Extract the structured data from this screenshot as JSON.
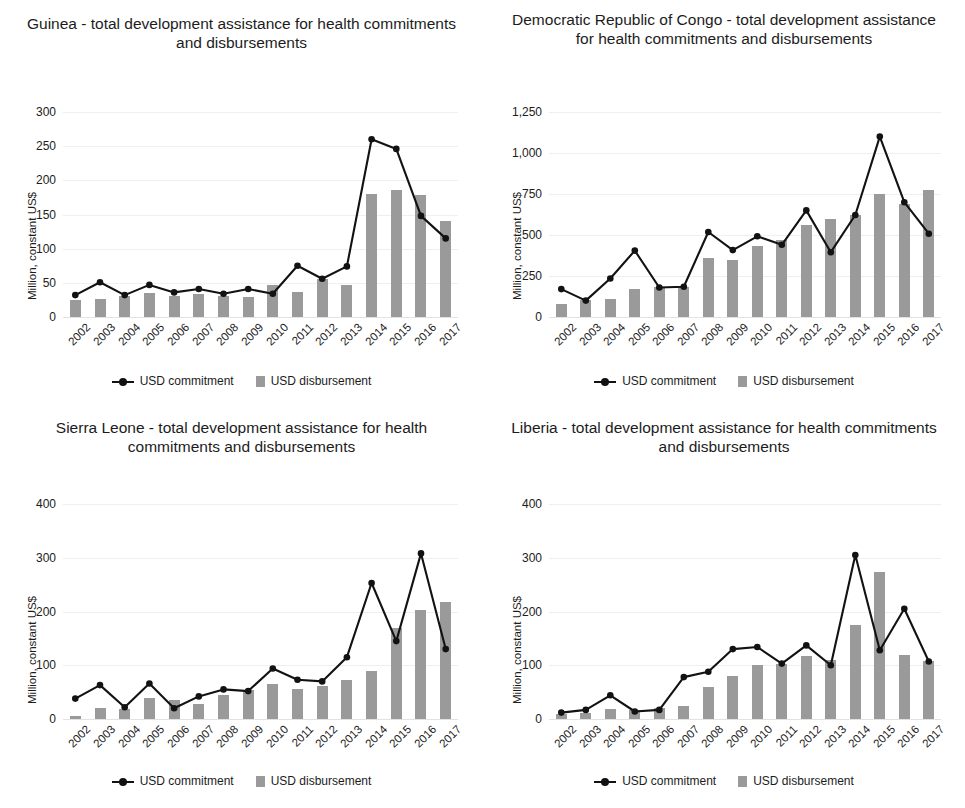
{
  "figure": {
    "series_labels": {
      "commitment": "USD commitment",
      "disbursement": "USD disbursement"
    },
    "colors": {
      "line": "#121212",
      "bar": "#9a9a9a",
      "gridline": "#efefef",
      "background": "#ffffff"
    }
  },
  "chart_data": [
    {
      "type": "bar",
      "id": "guinea",
      "title": "Guinea - total development assistance for health commitments and disbursements",
      "xlabel": "",
      "ylabel": "Million, constant US$",
      "ylim": [
        0,
        300
      ],
      "yticks": [
        0,
        50,
        100,
        150,
        200,
        250,
        300
      ],
      "ytick_labels": [
        "0",
        "50",
        "100",
        "150",
        "200",
        "250",
        "300"
      ],
      "grid": true,
      "legend_position": "bottom",
      "categories": [
        "2002",
        "2003",
        "2004",
        "2005",
        "2006",
        "2007",
        "2008",
        "2009",
        "2010",
        "2011",
        "2012",
        "2013",
        "2014",
        "2015",
        "2016",
        "2017"
      ],
      "series": [
        {
          "name": "USD disbursement",
          "type": "bar",
          "values": [
            25,
            26,
            31,
            35,
            31,
            33,
            31,
            30,
            47,
            37,
            56,
            47,
            180,
            186,
            178,
            141
          ]
        },
        {
          "name": "USD commitment",
          "type": "line",
          "values": [
            32,
            51,
            32,
            47,
            36,
            41,
            34,
            41,
            34,
            75,
            56,
            74,
            260,
            246,
            148,
            115
          ]
        }
      ]
    },
    {
      "type": "bar",
      "id": "drc",
      "title": "Democratic Republic of Congo - total development assistance for health commitments and disbursements",
      "xlabel": "",
      "ylabel": "Million, constant US$",
      "ylim": [
        0,
        1250
      ],
      "yticks": [
        0,
        250,
        500,
        750,
        1000,
        1250
      ],
      "ytick_labels": [
        "0",
        "250",
        "500",
        "750",
        "1,000",
        "1,250"
      ],
      "grid": true,
      "legend_position": "bottom",
      "categories": [
        "2002",
        "2003",
        "2004",
        "2005",
        "2006",
        "2007",
        "2008",
        "2009",
        "2010",
        "2011",
        "2012",
        "2013",
        "2014",
        "2015",
        "2016",
        "2017"
      ],
      "series": [
        {
          "name": "USD disbursement",
          "type": "bar",
          "values": [
            80,
            105,
            107,
            172,
            183,
            182,
            362,
            350,
            432,
            468,
            560,
            600,
            620,
            748,
            690,
            775
          ]
        },
        {
          "name": "USD commitment",
          "type": "line",
          "values": [
            170,
            100,
            235,
            405,
            180,
            185,
            518,
            408,
            492,
            440,
            650,
            395,
            622,
            1100,
            700,
            508
          ]
        }
      ]
    },
    {
      "type": "bar",
      "id": "sierra-leone",
      "title": "Sierra Leone - total development assistance for health commitments and disbursements",
      "xlabel": "",
      "ylabel": "Million, constant US$",
      "ylim": [
        0,
        400
      ],
      "yticks": [
        0,
        100,
        200,
        300,
        400
      ],
      "ytick_labels": [
        "0",
        "100",
        "200",
        "300",
        "400"
      ],
      "grid": true,
      "legend_position": "bottom",
      "categories": [
        "2002",
        "2003",
        "2004",
        "2005",
        "2006",
        "2007",
        "2008",
        "2009",
        "2010",
        "2011",
        "2012",
        "2013",
        "2014",
        "2015",
        "2016",
        "2017"
      ],
      "series": [
        {
          "name": "USD disbursement",
          "type": "bar",
          "values": [
            5,
            20,
            18,
            40,
            35,
            28,
            45,
            54,
            66,
            55,
            62,
            72,
            90,
            170,
            203,
            218,
            177
          ]
        },
        {
          "name": "USD commitment",
          "type": "line",
          "values": [
            38,
            63,
            22,
            66,
            20,
            42,
            55,
            52,
            94,
            73,
            70,
            115,
            253,
            145,
            308,
            130
          ]
        }
      ]
    },
    {
      "type": "bar",
      "id": "liberia",
      "title": "Liberia - total development assistance for health commitments and disbursements",
      "xlabel": "",
      "ylabel": "Million, constant US$",
      "ylim": [
        0,
        400
      ],
      "yticks": [
        0,
        100,
        200,
        300,
        400
      ],
      "ytick_labels": [
        "0",
        "100",
        "200",
        "300",
        "400"
      ],
      "grid": true,
      "legend_position": "bottom",
      "categories": [
        "2002",
        "2003",
        "2004",
        "2005",
        "2006",
        "2007",
        "2008",
        "2009",
        "2010",
        "2011",
        "2012",
        "2013",
        "2014",
        "2015",
        "2016",
        "2017"
      ],
      "series": [
        {
          "name": "USD disbursement",
          "type": "bar",
          "values": [
            10,
            12,
            18,
            16,
            21,
            25,
            60,
            80,
            100,
            103,
            117,
            110,
            175,
            273,
            120,
            108
          ]
        },
        {
          "name": "USD commitment",
          "type": "line",
          "values": [
            12,
            17,
            44,
            14,
            17,
            78,
            88,
            130,
            134,
            103,
            137,
            100,
            305,
            128,
            205,
            107
          ]
        }
      ]
    }
  ]
}
